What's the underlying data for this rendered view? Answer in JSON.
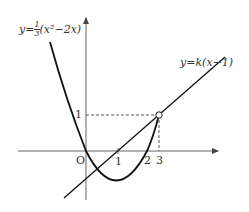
{
  "diagram": {
    "curve_label": {
      "prefix": "y=",
      "frac_num": "1",
      "frac_den": "3",
      "suffix": "(x²−2x)"
    },
    "line_label": "y=k(x−1)",
    "origin_label": "O",
    "y_tick_label": "1",
    "x_tick_labels": [
      "1",
      "2",
      "3"
    ],
    "colors": {
      "curve": "#111111",
      "axis": "#555555",
      "dashed": "#444444"
    }
  }
}
